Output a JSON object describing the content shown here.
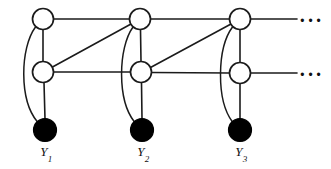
{
  "figure": {
    "background_color": "#ffffff",
    "stroke_color": "#1b1b1b",
    "observed_node_color": "#000000",
    "hidden_node_color": "#ffffff",
    "width": 331,
    "height": 169
  },
  "nodes": {
    "hidden_row_top": [
      {
        "id": "h1",
        "cx": 43,
        "cy": 19,
        "r": 10.5,
        "state": "open"
      },
      {
        "id": "h2",
        "cx": 140,
        "cy": 19,
        "r": 10.5,
        "state": "open"
      },
      {
        "id": "h3",
        "cx": 240,
        "cy": 19,
        "r": 10.5,
        "state": "open"
      }
    ],
    "hidden_row_bottom": [
      {
        "id": "g1",
        "cx": 43,
        "cy": 72,
        "r": 10.5,
        "state": "open"
      },
      {
        "id": "g2",
        "cx": 141,
        "cy": 72,
        "r": 10.5,
        "state": "open"
      },
      {
        "id": "g3",
        "cx": 240,
        "cy": 73,
        "r": 10.5,
        "state": "open"
      }
    ],
    "observed_row": [
      {
        "id": "y1",
        "cx": 45,
        "cy": 130,
        "r": 11.5,
        "state": "filled"
      },
      {
        "id": "y2",
        "cx": 142,
        "cy": 130,
        "r": 11.5,
        "state": "filled"
      },
      {
        "id": "y3",
        "cx": 240,
        "cy": 130,
        "r": 11.5,
        "state": "filled"
      }
    ]
  },
  "edges": {
    "horizontal_top": [
      {
        "from": "h1",
        "to": "h2",
        "x1": 53.5,
        "y1": 19,
        "x2": 129.5,
        "y2": 19
      },
      {
        "from": "h2",
        "to": "h3",
        "x1": 150.5,
        "y1": 19,
        "x2": 229.5,
        "y2": 19
      },
      {
        "from": "h3",
        "to": "continuation",
        "x1": 250.5,
        "y1": 19,
        "x2": 297,
        "y2": 19
      }
    ],
    "horizontal_bottom": [
      {
        "from": "g1",
        "to": "g2",
        "x1": 53.5,
        "y1": 72,
        "x2": 130.5,
        "y2": 72
      },
      {
        "from": "g2",
        "to": "g3",
        "x1": 151.5,
        "y1": 72.5,
        "x2": 229.5,
        "y2": 73
      },
      {
        "from": "g3",
        "to": "continuation",
        "x1": 250.5,
        "y1": 73,
        "x2": 297,
        "y2": 73
      }
    ],
    "vertical_hidden": [
      {
        "from": "h1",
        "to": "g1",
        "x1": 43,
        "y1": 29.5,
        "x2": 43,
        "y2": 61.5
      },
      {
        "from": "h2",
        "to": "g2",
        "x1": 140.5,
        "y1": 29.5,
        "x2": 141,
        "y2": 61.5
      },
      {
        "from": "h3",
        "to": "g3",
        "x1": 240,
        "y1": 29.5,
        "x2": 240,
        "y2": 62.5
      }
    ],
    "vertical_observed": [
      {
        "from": "g1",
        "to": "y1",
        "x1": 44,
        "y1": 82.5,
        "x2": 45,
        "y2": 119
      },
      {
        "from": "g2",
        "to": "y2",
        "x1": 141.5,
        "y1": 82.5,
        "x2": 142,
        "y2": 119
      },
      {
        "from": "g3",
        "to": "y3",
        "x1": 240,
        "y1": 83.5,
        "x2": 240,
        "y2": 119
      }
    ],
    "diagonals": [
      {
        "from": "g1",
        "to": "h2",
        "x1": 52.5,
        "y1": 67,
        "x2": 131,
        "y2": 24
      },
      {
        "from": "g2",
        "to": "h3",
        "x1": 150.5,
        "y1": 67.5,
        "x2": 231,
        "y2": 24
      }
    ],
    "curved_skip": [
      {
        "from": "h1",
        "to": "y1",
        "path": "M 35.5 27 C 20 48, 19 100, 37.5 122"
      },
      {
        "from": "h2",
        "to": "y2",
        "path": "M 133 27 C 118 48, 117 100, 134.5 122"
      },
      {
        "from": "h3",
        "to": "y3",
        "path": "M 232.5 27 C 217 48, 216 100, 232.5 122"
      }
    ]
  },
  "continuation": {
    "top_dots": {
      "glyph": "···",
      "x": 299,
      "y": 10
    },
    "bottom_dots": {
      "glyph": "···",
      "x": 299,
      "y": 64
    }
  },
  "labels": {
    "observed": [
      {
        "base": "Y",
        "subscript": "1",
        "x": 46,
        "y": 144
      },
      {
        "base": "Y",
        "subscript": "2",
        "x": 143,
        "y": 144
      },
      {
        "base": "Y",
        "subscript": "3",
        "x": 241,
        "y": 144
      }
    ]
  }
}
